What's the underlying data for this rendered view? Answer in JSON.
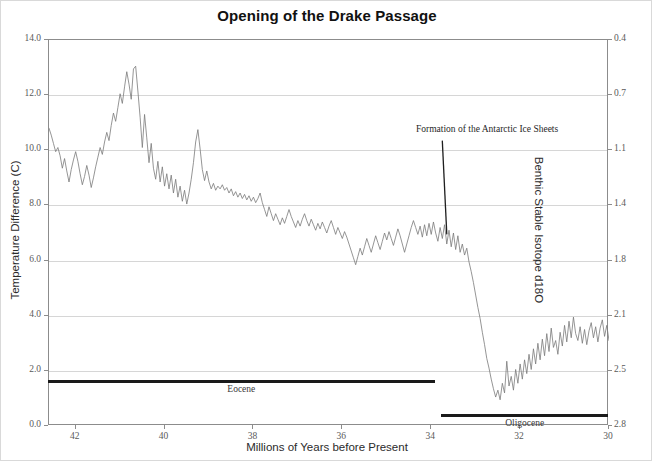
{
  "chart_data": {
    "type": "line",
    "title": "Opening of the Drake Passage",
    "xlabel": "Millions of Years before Present",
    "ylabel": "Temperature Difference (C)",
    "ylabel_right": "Benthic Stable Isotope d18O",
    "xlim": [
      42.6,
      30.0
    ],
    "x_reversed": true,
    "ylim": [
      0.0,
      14.0
    ],
    "y_ticks": [
      "0.0",
      "2.0",
      "4.0",
      "6.0",
      "8.0",
      "10.0",
      "12.0",
      "14.0"
    ],
    "y_tick_values": [
      0,
      2,
      4,
      6,
      8,
      10,
      12,
      14
    ],
    "x_ticks": [
      "42",
      "40",
      "38",
      "36",
      "34",
      "32",
      "30"
    ],
    "x_tick_values": [
      42,
      40,
      38,
      36,
      34,
      32,
      30
    ],
    "y_ticks_right": [
      "0.4",
      "0.7",
      "1.1",
      "1.4",
      "1.8",
      "2.1",
      "2.5",
      "2.8"
    ],
    "y_right_tick_values": [
      0.4,
      0.7,
      1.1,
      1.4,
      1.8,
      2.1,
      2.5,
      2.8
    ],
    "right_axis_inverted": true,
    "grid": "horizontal",
    "legend": "none",
    "series_name": "Temperature Difference",
    "series_color": "#7a7a7a",
    "annotations": [
      {
        "text": "Formation of the Antarctic Ice Sheets",
        "x": 34.05,
        "y": 10.7,
        "point_x": 33.65,
        "point_y": 6.95
      }
    ],
    "epochs": [
      {
        "label": "Eocene",
        "start": 42.6,
        "end": 33.9,
        "y": 1.65
      },
      {
        "label": "Oligocene",
        "start": 33.75,
        "end": 30.0,
        "y": 0.4
      }
    ],
    "x": [
      42.6,
      42.55,
      42.5,
      42.45,
      42.4,
      42.35,
      42.3,
      42.25,
      42.2,
      42.15,
      42.1,
      42.05,
      42.0,
      41.95,
      41.9,
      41.85,
      41.8,
      41.75,
      41.7,
      41.65,
      41.6,
      41.55,
      41.5,
      41.45,
      41.4,
      41.35,
      41.3,
      41.25,
      41.2,
      41.15,
      41.1,
      41.05,
      41.0,
      40.95,
      40.9,
      40.85,
      40.8,
      40.75,
      40.7,
      40.65,
      40.6,
      40.55,
      40.5,
      40.45,
      40.4,
      40.35,
      40.3,
      40.25,
      40.2,
      40.15,
      40.1,
      40.05,
      40.0,
      39.95,
      39.9,
      39.85,
      39.8,
      39.75,
      39.7,
      39.65,
      39.6,
      39.55,
      39.5,
      39.45,
      39.4,
      39.35,
      39.3,
      39.25,
      39.2,
      39.15,
      39.1,
      39.05,
      39.0,
      38.95,
      38.9,
      38.85,
      38.8,
      38.75,
      38.7,
      38.65,
      38.6,
      38.55,
      38.5,
      38.45,
      38.4,
      38.35,
      38.3,
      38.25,
      38.2,
      38.15,
      38.1,
      38.05,
      38.0,
      37.95,
      37.9,
      37.85,
      37.8,
      37.75,
      37.7,
      37.65,
      37.6,
      37.55,
      37.5,
      37.45,
      37.4,
      37.35,
      37.3,
      37.25,
      37.2,
      37.15,
      37.1,
      37.05,
      37.0,
      36.95,
      36.9,
      36.85,
      36.8,
      36.75,
      36.7,
      36.65,
      36.6,
      36.55,
      36.5,
      36.45,
      36.4,
      36.35,
      36.3,
      36.25,
      36.2,
      36.15,
      36.1,
      36.05,
      36.0,
      35.95,
      35.9,
      35.85,
      35.8,
      35.75,
      35.7,
      35.65,
      35.6,
      35.55,
      35.5,
      35.45,
      35.4,
      35.35,
      35.3,
      35.25,
      35.2,
      35.15,
      35.1,
      35.05,
      35.0,
      34.95,
      34.9,
      34.85,
      34.8,
      34.75,
      34.7,
      34.65,
      34.6,
      34.55,
      34.5,
      34.45,
      34.4,
      34.35,
      34.3,
      34.25,
      34.2,
      34.15,
      34.1,
      34.05,
      34.0,
      33.95,
      33.9,
      33.85,
      33.8,
      33.75,
      33.7,
      33.65,
      33.6,
      33.55,
      33.5,
      33.45,
      33.4,
      33.35,
      33.3,
      33.25,
      33.2,
      33.15,
      33.1,
      33.05,
      33.0,
      32.95,
      32.9,
      32.85,
      32.8,
      32.75,
      32.7,
      32.65,
      32.6,
      32.55,
      32.5,
      32.45,
      32.4,
      32.35,
      32.3,
      32.25,
      32.2,
      32.15,
      32.1,
      32.05,
      32.0,
      31.95,
      31.9,
      31.85,
      31.8,
      31.75,
      31.7,
      31.65,
      31.6,
      31.55,
      31.5,
      31.45,
      31.4,
      31.35,
      31.3,
      31.25,
      31.2,
      31.15,
      31.1,
      31.05,
      31.0,
      30.95,
      30.9,
      30.85,
      30.8,
      30.75,
      30.7,
      30.65,
      30.6,
      30.55,
      30.5,
      30.45,
      30.4,
      30.35,
      30.3,
      30.25,
      30.2,
      30.15,
      30.1,
      30.05,
      30.0
    ],
    "y": [
      10.8,
      10.55,
      10.25,
      9.95,
      10.1,
      9.8,
      9.35,
      9.7,
      9.25,
      8.85,
      9.3,
      9.65,
      9.95,
      9.6,
      9.15,
      8.75,
      9.05,
      9.45,
      9.1,
      8.65,
      9.0,
      9.4,
      9.75,
      10.1,
      9.85,
      10.3,
      10.65,
      10.35,
      10.9,
      11.35,
      11.05,
      11.55,
      12.05,
      11.7,
      12.3,
      12.85,
      12.4,
      11.85,
      12.95,
      13.05,
      12.15,
      11.2,
      10.1,
      11.3,
      10.45,
      9.55,
      10.25,
      9.35,
      8.95,
      9.6,
      8.85,
      9.4,
      8.7,
      9.15,
      8.6,
      9.1,
      8.45,
      8.95,
      8.3,
      8.7,
      8.15,
      8.55,
      8.05,
      8.45,
      8.95,
      9.55,
      10.3,
      10.75,
      10.05,
      9.3,
      8.9,
      9.25,
      8.85,
      8.6,
      8.8,
      8.55,
      8.7,
      8.6,
      8.75,
      8.55,
      8.65,
      8.45,
      8.6,
      8.35,
      8.5,
      8.3,
      8.45,
      8.25,
      8.4,
      8.2,
      8.35,
      8.15,
      8.3,
      8.1,
      8.25,
      8.45,
      8.1,
      7.85,
      7.6,
      7.95,
      7.7,
      7.45,
      7.7,
      7.5,
      7.3,
      7.55,
      7.35,
      7.6,
      7.85,
      7.6,
      7.4,
      7.2,
      7.45,
      7.25,
      7.5,
      7.7,
      7.45,
      7.25,
      7.5,
      7.3,
      7.1,
      7.35,
      7.15,
      7.4,
      7.2,
      7.0,
      7.25,
      7.45,
      7.2,
      6.95,
      7.2,
      7.0,
      6.8,
      7.05,
      6.85,
      6.6,
      6.35,
      6.1,
      5.85,
      6.15,
      6.45,
      6.2,
      6.5,
      6.8,
      6.55,
      6.3,
      6.6,
      6.9,
      6.65,
      6.4,
      6.7,
      7.0,
      6.75,
      7.05,
      6.8,
      6.55,
      6.85,
      7.15,
      6.9,
      6.6,
      6.3,
      6.6,
      6.9,
      7.2,
      7.45,
      7.2,
      6.95,
      7.25,
      6.85,
      7.3,
      6.9,
      7.35,
      6.95,
      7.4,
      7.0,
      6.7,
      7.2,
      6.8,
      7.3,
      6.6,
      7.1,
      6.5,
      7.0,
      6.4,
      6.9,
      6.3,
      6.6,
      6.2,
      6.45,
      5.95,
      5.6,
      5.2,
      4.75,
      4.3,
      3.9,
      3.4,
      2.95,
      2.45,
      2.1,
      1.7,
      1.35,
      1.05,
      1.3,
      0.95,
      1.55,
      1.2,
      2.35,
      1.45,
      1.8,
      1.3,
      2.05,
      1.55,
      2.25,
      1.7,
      2.4,
      1.9,
      2.6,
      2.05,
      2.8,
      2.25,
      3.0,
      2.4,
      3.15,
      2.55,
      3.35,
      2.7,
      3.55,
      2.85,
      3.1,
      2.6,
      3.4,
      2.9,
      3.65,
      3.05,
      3.8,
      3.2,
      3.95,
      3.35,
      3.1,
      3.6,
      3.0,
      3.5,
      2.95,
      3.45,
      3.75,
      3.2,
      3.6,
      3.05,
      3.55,
      3.85,
      3.25,
      3.65,
      3.1,
      3.5,
      2.95,
      3.4,
      3.7,
      3.15,
      3.55,
      3.0,
      2.45,
      2.2,
      2.65,
      2.9,
      3.25,
      2.8,
      3.1,
      3.45,
      2.95,
      3.3,
      2.75,
      3.15,
      2.6,
      3.05,
      3.4,
      2.85,
      3.25,
      3.6,
      3.05,
      3.45,
      2.9,
      3.3,
      3.65
    ]
  }
}
